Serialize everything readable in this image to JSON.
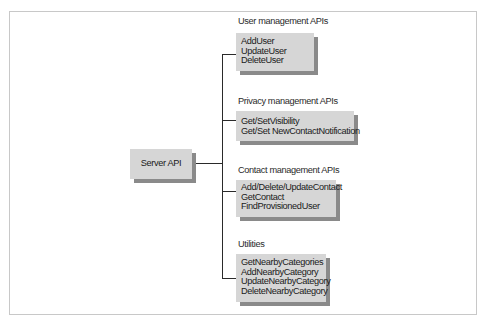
{
  "diagram": {
    "root": {
      "label": "Server API"
    },
    "groups": [
      {
        "title": "User management APIs",
        "items": [
          "AddUser",
          "UpdateUser",
          "DeleteUser"
        ]
      },
      {
        "title": "Privacy management APIs",
        "items": [
          "Get/SetVisibility",
          "Get/Set NewContactNotification"
        ]
      },
      {
        "title": "Contact management APIs",
        "items": [
          "Add/Delete/UpdateContact",
          "GetContact",
          "FindProvisionedUser"
        ]
      },
      {
        "title": "Utilities",
        "items": [
          "GetNearbyCategories",
          "AddNearbyCategory",
          "UpdateNearbyCategory",
          "DeleteNearbyCategory"
        ]
      }
    ],
    "colors": {
      "box_fill": "#d6d6d6",
      "box_shadow": "#8a8a8a",
      "line": "#2a2a2a",
      "frame": "#c8c8c8"
    }
  }
}
